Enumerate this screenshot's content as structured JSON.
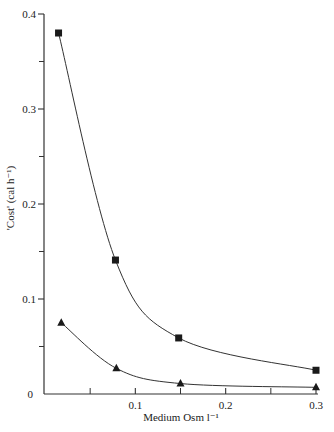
{
  "chart_data": {
    "type": "line",
    "title": "",
    "xlabel": "Medium Osm l⁻¹",
    "ylabel": "'Cost' (cal h⁻¹)",
    "xlim": [
      0,
      0.3
    ],
    "ylim": [
      0,
      0.4
    ],
    "x_major_ticks": [
      0.1,
      0.2,
      0.3
    ],
    "x_tick_labels": [
      "0.1",
      "0.2",
      "0.3"
    ],
    "x_minor_ticks": [
      0.05,
      0.15,
      0.25
    ],
    "y_major_ticks": [
      0,
      0.1,
      0.2,
      0.3,
      0.4
    ],
    "y_tick_labels": [
      "0",
      "0.1",
      "0.2",
      "0.3",
      "0.4"
    ],
    "y_minor_ticks": [
      0.05,
      0.15,
      0.25,
      0.35
    ],
    "grid": false,
    "legend": "none",
    "series": [
      {
        "name": "squares",
        "marker": "square",
        "x": [
          0.015,
          0.078,
          0.148,
          0.3
        ],
        "y": [
          0.38,
          0.141,
          0.059,
          0.025
        ]
      },
      {
        "name": "triangles",
        "marker": "triangle",
        "x": [
          0.018,
          0.079,
          0.15,
          0.3
        ],
        "y": [
          0.075,
          0.027,
          0.011,
          0.007
        ]
      }
    ]
  }
}
